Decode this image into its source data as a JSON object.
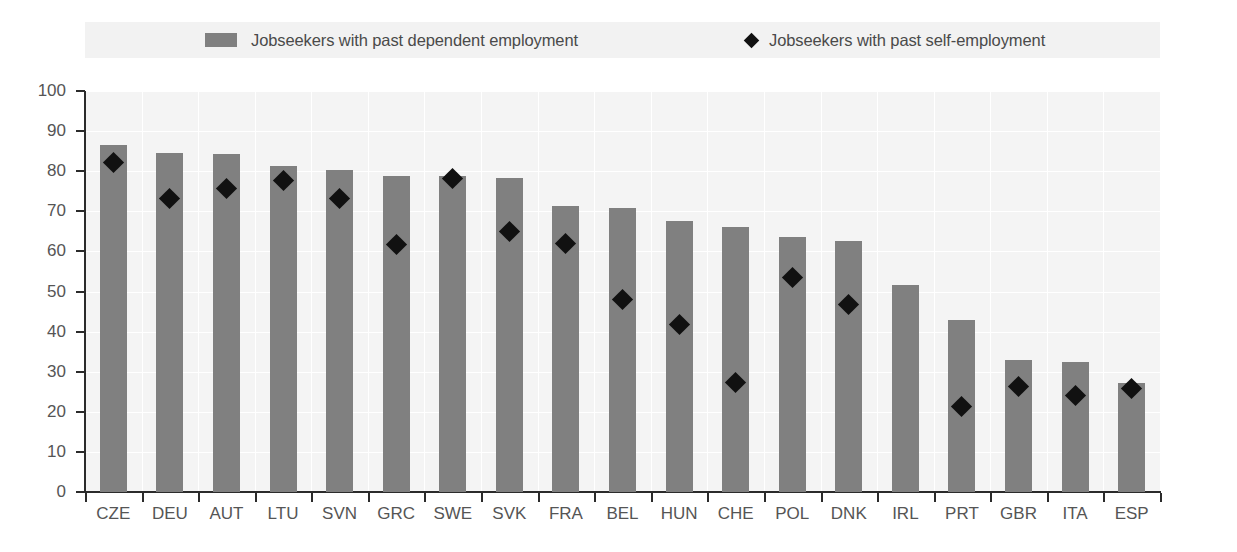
{
  "chart_data": {
    "type": "bar",
    "title": "",
    "subtitle": "",
    "xlabel": "",
    "ylabel": "",
    "ylim": [
      0,
      100
    ],
    "ytick_step": 10,
    "yticks": [
      0,
      10,
      20,
      30,
      40,
      50,
      60,
      70,
      80,
      90,
      100
    ],
    "grid": true,
    "grid_orientation": "both",
    "legend_position": "top",
    "categories": [
      "CZE",
      "DEU",
      "AUT",
      "LTU",
      "SVN",
      "GRC",
      "SWE",
      "SVK",
      "FRA",
      "BEL",
      "HUN",
      "CHE",
      "POL",
      "DNK",
      "IRL",
      "PRT",
      "GBR",
      "ITA",
      "ESP"
    ],
    "series": [
      {
        "name": "Jobseekers with past dependent employment",
        "type": "bar",
        "color": "#808080",
        "values": [
          86.5,
          84.6,
          84.4,
          81.2,
          80.4,
          78.8,
          78.9,
          78.4,
          71.3,
          70.9,
          67.7,
          66.0,
          63.7,
          62.7,
          51.5,
          43.0,
          32.8,
          32.5,
          27.1
        ]
      },
      {
        "name": "Jobseekers with past self-employment",
        "type": "scatter",
        "marker": "diamond",
        "color": "#111111",
        "values": [
          82.2,
          73.3,
          75.6,
          77.8,
          73.2,
          61.7,
          78.3,
          64.9,
          62.0,
          48.0,
          41.7,
          27.4,
          53.4,
          46.7,
          null,
          21.2,
          26.2,
          24.1,
          25.9
        ]
      }
    ]
  },
  "legend": {
    "entries": [
      {
        "label": "Jobseekers with past dependent employment",
        "marker": "square",
        "color": "#808080"
      },
      {
        "label": "Jobseekers with past self-employment",
        "marker": "diamond",
        "color": "#111111"
      }
    ]
  }
}
